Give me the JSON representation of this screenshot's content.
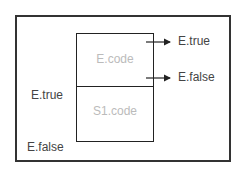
{
  "diagram": {
    "blocks": [
      {
        "id": "e-code",
        "label": "E.code"
      },
      {
        "id": "s1-code",
        "label": "S1.code"
      }
    ],
    "labels": {
      "exit_true": "E.true",
      "exit_false": "E.false",
      "entry_true": "E.true",
      "entry_false": "E.false"
    },
    "colors": {
      "stroke": "#222222",
      "text": "#444444",
      "code_text": "#bbbbbb"
    }
  }
}
